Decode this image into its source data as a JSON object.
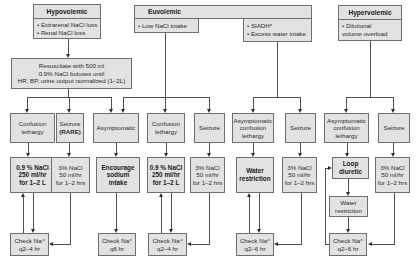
{
  "categories": {
    "hypovolemic": {
      "title": "Hypovolemic",
      "causes": "• Extrarenal NaCl loss\n• Renal NaCl  loss",
      "initial_step": "Resuscitate  with 500 ml\n0.9% NaCl boluses until\nHR, BP, urine output normalized (1–2L)"
    },
    "euvolemic": {
      "title": "Euvolemic",
      "causes_left": "• Low NaCl intake",
      "causes_right": "• SIADH*\n• Excess water intake"
    },
    "hypervolemic": {
      "title": "Hypervolemic",
      "causes": "• Dilutional\n  volume overload"
    }
  },
  "symptoms": {
    "hypo_confusion": "Confusion\nlethargy",
    "hypo_seizure_line1": "Seizure",
    "hypo_seizure_line2": "(RARE)",
    "asymptomatic": "Asymptomatic",
    "euvo_confusion": "Confusion\nlethargy",
    "euvo_seizure": "Seizure",
    "siadh_asym_confusion": "Asymptomatic\nconfusion\nlethargy",
    "siadh_seizure": "Seizure",
    "hyper_asym_confusion": "Asymptomatic\nconfusion\nlethargy",
    "hyper_seizure": "Seizure"
  },
  "treatments": {
    "hypo_saline": "0.9 % NaCl\n250 ml/hr\nfor 1–2 L",
    "hypo_hypertonic": "3% NaCl\n50 ml/hr\nfor 1–2 hrs",
    "encourage_sodium": "Encourage\nsodium\nintake",
    "euvo_saline": "0.9 % NaCl\n250 ml/hr\nfor 1–2 L",
    "euvo_hypertonic": "3% NaCl\n50 ml/hr\nfor 1–2 hrs",
    "water_restriction_bold": "Water\nrestriction",
    "siadh_hypertonic": "3% NaCl\n50 ml/hr\nfor 1–2 hrs",
    "loop_diuretic": "Loop\ndiuretic",
    "hyper_water_restriction": "Water\nrestriction",
    "hyper_hypertonic": "3% NaCl\n50 ml/hr\nfor 1–2 hrs"
  },
  "monitoring": {
    "check_1": "Check Na⁺\nq2–4 hr",
    "check_2": "Check Na⁺\nq6 hr",
    "check_3": "Check Na⁺\nq2–4 hr",
    "check_4": "Check Na⁺\nq2–6 hr",
    "check_5": "Check Na⁺\nq2–6 hr"
  },
  "colors": {
    "box_fill": "#e2e2e2",
    "box_border": "#6f6f6f",
    "connector": "#505050"
  }
}
